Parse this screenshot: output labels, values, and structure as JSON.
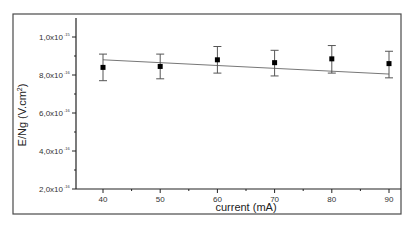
{
  "chart_data": {
    "type": "scatter",
    "title": "",
    "xlabel": "current (mA)",
    "ylabel": "E/Ng (V.cm²)",
    "x": [
      40,
      50,
      60,
      70,
      80,
      90
    ],
    "series": [
      {
        "name": "E/Ng",
        "marker": "square",
        "values": [
          8.4e-16,
          8.45e-16,
          8.8e-16,
          8.65e-16,
          8.85e-16,
          8.6e-16
        ],
        "error_upper": [
          9.1e-16,
          9.1e-16,
          9.5e-16,
          9.3e-16,
          9.55e-16,
          9.25e-16
        ],
        "error_lower": [
          7.7e-16,
          7.8e-16,
          8.1e-16,
          7.95e-16,
          8.1e-16,
          7.85e-16
        ]
      },
      {
        "name": "linear fit",
        "type": "line",
        "x": [
          40,
          90
        ],
        "values": [
          8.8e-16,
          8.05e-16
        ]
      }
    ],
    "xticks": [
      "40",
      "50",
      "60",
      "70",
      "80",
      "90"
    ],
    "yticks": [
      {
        "mantissa": "2,0x10",
        "exp": "-16",
        "value": 2e-16
      },
      {
        "mantissa": "4,0x10",
        "exp": "-16",
        "value": 4e-16
      },
      {
        "mantissa": "6,0x10",
        "exp": "-16",
        "value": 6e-16
      },
      {
        "mantissa": "8,0x10",
        "exp": "-16",
        "value": 8e-16
      },
      {
        "mantissa": "1,0x10",
        "exp": "-15",
        "value": 1e-15
      }
    ],
    "xlim": [
      35,
      92
    ],
    "ylim": [
      2e-16,
      1.1e-15
    ],
    "grid": false,
    "legend": "none"
  },
  "labels": {
    "xlabel": "current (mA)",
    "ylabel_main": "E/Ng (V.cm",
    "ylabel_sup": "2",
    "ylabel_close": ")"
  }
}
